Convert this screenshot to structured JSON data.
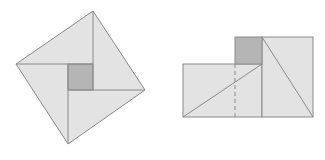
{
  "diagram": {
    "colors": {
      "background": "#ffffff",
      "fill_light": "#e3e3e3",
      "fill_dark": "#b5b5b5",
      "stroke": "#8a8a8a"
    },
    "left_figure": {
      "description": "Tilted square composed of four congruent right triangles around a small central square",
      "outer_vertices": [
        [
          93,
          11
        ],
        [
          145,
          90
        ],
        [
          68,
          144
        ],
        [
          16,
          64
        ]
      ],
      "inner_square": {
        "x": 68,
        "y": 64,
        "width": 25,
        "height": 26
      }
    },
    "right_figure": {
      "description": "Same pieces rearranged into two adjacent rectangles plus small square",
      "left_rect": {
        "x": 183,
        "y": 64,
        "width": 79,
        "height": 53
      },
      "small_square": {
        "x": 235,
        "y": 37,
        "width": 26,
        "height": 27
      },
      "right_rect": {
        "x": 262,
        "y": 37,
        "width": 51,
        "height": 80
      },
      "dashed_line": {
        "x": 235,
        "y1": 64,
        "y2": 117
      },
      "diagonals": [
        [
          [
            183,
            117
          ],
          [
            262,
            64
          ]
        ],
        [
          [
            262,
            37
          ],
          [
            313,
            117
          ]
        ]
      ]
    }
  }
}
